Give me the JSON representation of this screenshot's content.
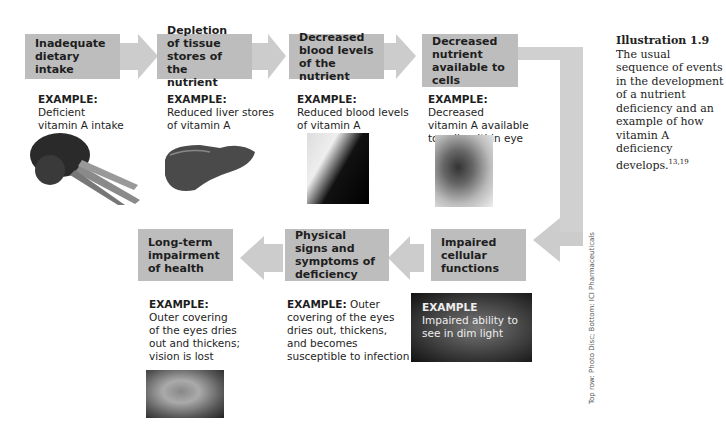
{
  "colors": {
    "box": "#bdbdbd",
    "arrow": "#cccccc",
    "text": "#1e1e1e"
  },
  "top_row": [
    {
      "label": "Inadequate dietary intake",
      "example_label": "EXAMPLE:",
      "example_text": "Deficient\nvitamin A intake",
      "image": "carrots-image"
    },
    {
      "label": "Depletion of tissue stores of the nutrient",
      "example_label": "EXAMPLE:",
      "example_text": "Reduced liver stores\nof vitamin A",
      "image": "liver-image"
    },
    {
      "label": "Decreased blood levels of the nutrient",
      "example_label": "EXAMPLE:",
      "example_text": "Reduced blood levels\nof vitamin A",
      "image": "blood-test-image"
    },
    {
      "label": "Decreased nutrient available to cells",
      "example_label": "EXAMPLE:",
      "example_text": "Decreased\nvitamin A available\nto cells within eye",
      "image": "eye-closeup-image"
    }
  ],
  "bottom_row": [
    {
      "label": "Impaired cellular functions",
      "example_label": "EXAMPLE",
      "example_text": "Impaired ability to\nsee in dim light",
      "image": "dim-light-image"
    },
    {
      "label": "Physical signs and symptoms of deficiency",
      "example_label": "EXAMPLE:",
      "example_text": "Outer\ncovering of the eyes\ndries out, thickens,\nand becomes\nsusceptible to infection"
    },
    {
      "label": "Long-term impairment of health",
      "example_label": "EXAMPLE:",
      "example_text": "Outer covering\nof the eyes dries\nout and thickens;\nvision is lost",
      "image": "damaged-eye-image"
    }
  ],
  "caption": {
    "title": "Illustration 1.9",
    "text": "The usual sequence of events in the development of a nutrient deficiency and an example of how vitamin A deficiency develops.",
    "refs": "13,19"
  },
  "credit": "Top row: Photo Disc; Bottom: ICI Pharmaceuticals"
}
